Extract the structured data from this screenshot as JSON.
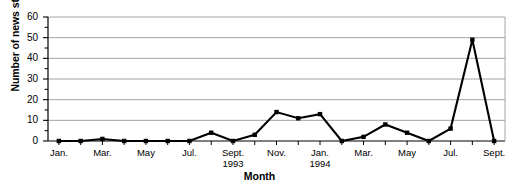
{
  "chart_data": {
    "type": "line",
    "title": "",
    "xlabel": "Month",
    "ylabel": "Number of news stories",
    "ylim": [
      0,
      60
    ],
    "ymajor_ticks": [
      0,
      10,
      20,
      30,
      40,
      50,
      60
    ],
    "yminor_ticks": [
      5,
      15,
      25,
      35,
      45,
      55
    ],
    "grid": "horizontal",
    "legend": "none",
    "marker": "square",
    "line_color": "#000000",
    "grid_color": "#9a9a9a",
    "axis_color": "#000000",
    "categories": [
      "Jan. 1993",
      "Feb. 1993",
      "Mar. 1993",
      "Apr. 1993",
      "May 1993",
      "Jun. 1993",
      "Jul. 1993",
      "Aug. 1993",
      "Sept. 1993",
      "Oct. 1993",
      "Nov. 1993",
      "Dec. 1993",
      "Jan. 1994",
      "Feb. 1994",
      "Mar. 1994",
      "Apr. 1994",
      "May 1994",
      "Jun. 1994",
      "Jul. 1994",
      "Aug. 1994",
      "Sept. 1994"
    ],
    "values": [
      0,
      0,
      1,
      0,
      0,
      0,
      0,
      4,
      0,
      3,
      14,
      11,
      13,
      0,
      2,
      8,
      4,
      0,
      6,
      49,
      0
    ],
    "xtick_labels": [
      {
        "index": 0,
        "line1": "Jan.",
        "line2": ""
      },
      {
        "index": 2,
        "line1": "Mar.",
        "line2": ""
      },
      {
        "index": 4,
        "line1": "May",
        "line2": ""
      },
      {
        "index": 6,
        "line1": "Jul.",
        "line2": ""
      },
      {
        "index": 8,
        "line1": "Sept.",
        "line2": "1993"
      },
      {
        "index": 10,
        "line1": "Nov.",
        "line2": ""
      },
      {
        "index": 12,
        "line1": "Jan.",
        "line2": "1994"
      },
      {
        "index": 14,
        "line1": "Mar.",
        "line2": ""
      },
      {
        "index": 16,
        "line1": "May",
        "line2": ""
      },
      {
        "index": 18,
        "line1": "Jul.",
        "line2": ""
      },
      {
        "index": 20,
        "line1": "Sept.",
        "line2": ""
      }
    ]
  }
}
